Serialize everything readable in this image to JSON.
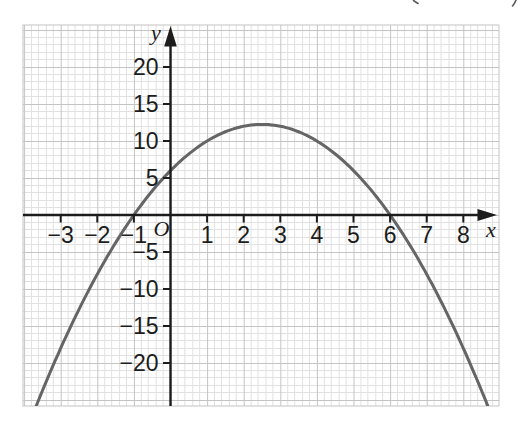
{
  "figure": {
    "background": "#ffffff",
    "axis_color": "#1c1c1c",
    "grid_minor_color": "#e1e1e1",
    "grid_major_color": "#c4c4c4",
    "curve_color": "#656565"
  },
  "chart_data": {
    "type": "line",
    "curve": "parabola-opening-down",
    "equation": {
      "a": -1,
      "b": 5,
      "c": 6,
      "text": "y = −x² + 5x + 6"
    },
    "x_intercepts": [
      -1,
      6
    ],
    "y_intercept": 6,
    "vertex": {
      "x": 2.5,
      "y": 12.25
    },
    "x_draw_range": [
      -3.72,
      8.72
    ],
    "sample_points": [
      [
        -3,
        -18
      ],
      [
        -2,
        -8
      ],
      [
        -1,
        0
      ],
      [
        0,
        6
      ],
      [
        1,
        10
      ],
      [
        2,
        12
      ],
      [
        2.5,
        12.25
      ],
      [
        3,
        12
      ],
      [
        4,
        10
      ],
      [
        5,
        6
      ],
      [
        6,
        0
      ],
      [
        7,
        -8
      ],
      [
        8,
        -18
      ]
    ],
    "x_axis": {
      "label": "x",
      "tick_values": [
        -3,
        -2,
        -1,
        1,
        2,
        3,
        4,
        5,
        6,
        7,
        8
      ],
      "tick_labels": [
        "−3",
        "−2",
        "−1",
        "1",
        "2",
        "3",
        "4",
        "5",
        "6",
        "7",
        "8"
      ],
      "visible_range": [
        -4,
        9
      ]
    },
    "y_axis": {
      "label": "y",
      "tick_values": [
        20,
        15,
        10,
        5,
        -5,
        -10,
        -15,
        -20
      ],
      "tick_labels": [
        "20",
        "15",
        "10",
        "5",
        "−5",
        "−10",
        "−15",
        "−20"
      ],
      "visible_range": [
        -25.8,
        25.7
      ]
    },
    "origin_label": "O",
    "grid": {
      "style": "graph-paper",
      "minor_per_major": 5,
      "x_units_per_major": 1,
      "y_units_per_major": 5
    },
    "legend": null,
    "title": ""
  }
}
